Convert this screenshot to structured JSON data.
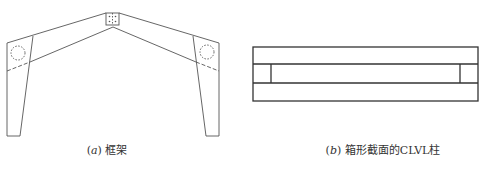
{
  "figure": {
    "panels": [
      {
        "id": "a",
        "caption_letter": "a",
        "caption_text": "框架",
        "description": "Portal frame with tapered columns, pitched rafters, apex connector and knee joints"
      },
      {
        "id": "b",
        "caption_letter": "b",
        "caption_text": "箱形截面的CLVL柱",
        "description": "Box cross-section of CLVL column"
      }
    ],
    "colors": {
      "line": "#444444",
      "background": "#ffffff",
      "text": "#333333"
    }
  }
}
